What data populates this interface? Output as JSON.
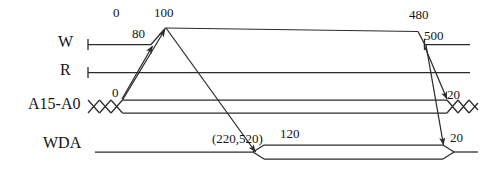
{
  "diagram": {
    "type": "timing-diagram",
    "title": "",
    "signals": [
      {
        "name": "W",
        "row_y": 44,
        "kind": "logic"
      },
      {
        "name": "R",
        "row_y": 72,
        "kind": "logic"
      },
      {
        "name": "A15-A0",
        "row_y": 106,
        "kind": "bus"
      },
      {
        "name": "WDA",
        "row_y": 145,
        "kind": "bus"
      }
    ],
    "labels": {
      "t0": "0",
      "t80": "80",
      "t100": "100",
      "t480": "480",
      "t500": "500",
      "addr_valid_start": "0",
      "addr_hold_right": "20",
      "wda_setup": "120",
      "wda_hold": "20",
      "wda_range": "(220,520)"
    },
    "colors": {
      "line": "#2b2b2b",
      "text": "#141414",
      "background": "#ffffff"
    }
  },
  "annotations": [
    {
      "id": "a-0",
      "text": "0",
      "x": 113,
      "y": 5
    },
    {
      "id": "a-100",
      "text": "100",
      "x": 154,
      "y": 5
    },
    {
      "id": "a-480",
      "text": "480",
      "x": 409,
      "y": 7
    },
    {
      "id": "a-80",
      "text": "80",
      "x": 132,
      "y": 26
    },
    {
      "id": "a-500",
      "text": "500",
      "x": 424,
      "y": 28
    },
    {
      "id": "a-addr0",
      "text": "0",
      "x": 112,
      "y": 85
    },
    {
      "id": "a-addr20",
      "text": "20",
      "x": 447,
      "y": 87
    },
    {
      "id": "a-wda120",
      "text": "120",
      "x": 280,
      "y": 126
    },
    {
      "id": "a-wda20",
      "text": "20",
      "x": 450,
      "y": 130
    },
    {
      "id": "a-wdarange",
      "text": "(220,520)",
      "x": 212,
      "y": 131
    }
  ],
  "signal_names": [
    {
      "id": "s-w",
      "text": "W",
      "x": 58,
      "y": 33
    },
    {
      "id": "s-r",
      "text": "R",
      "x": 60,
      "y": 61
    },
    {
      "id": "s-a",
      "text": "A15-A0",
      "x": 28,
      "y": 95
    },
    {
      "id": "s-wda",
      "text": "WDA",
      "x": 43,
      "y": 134
    }
  ]
}
